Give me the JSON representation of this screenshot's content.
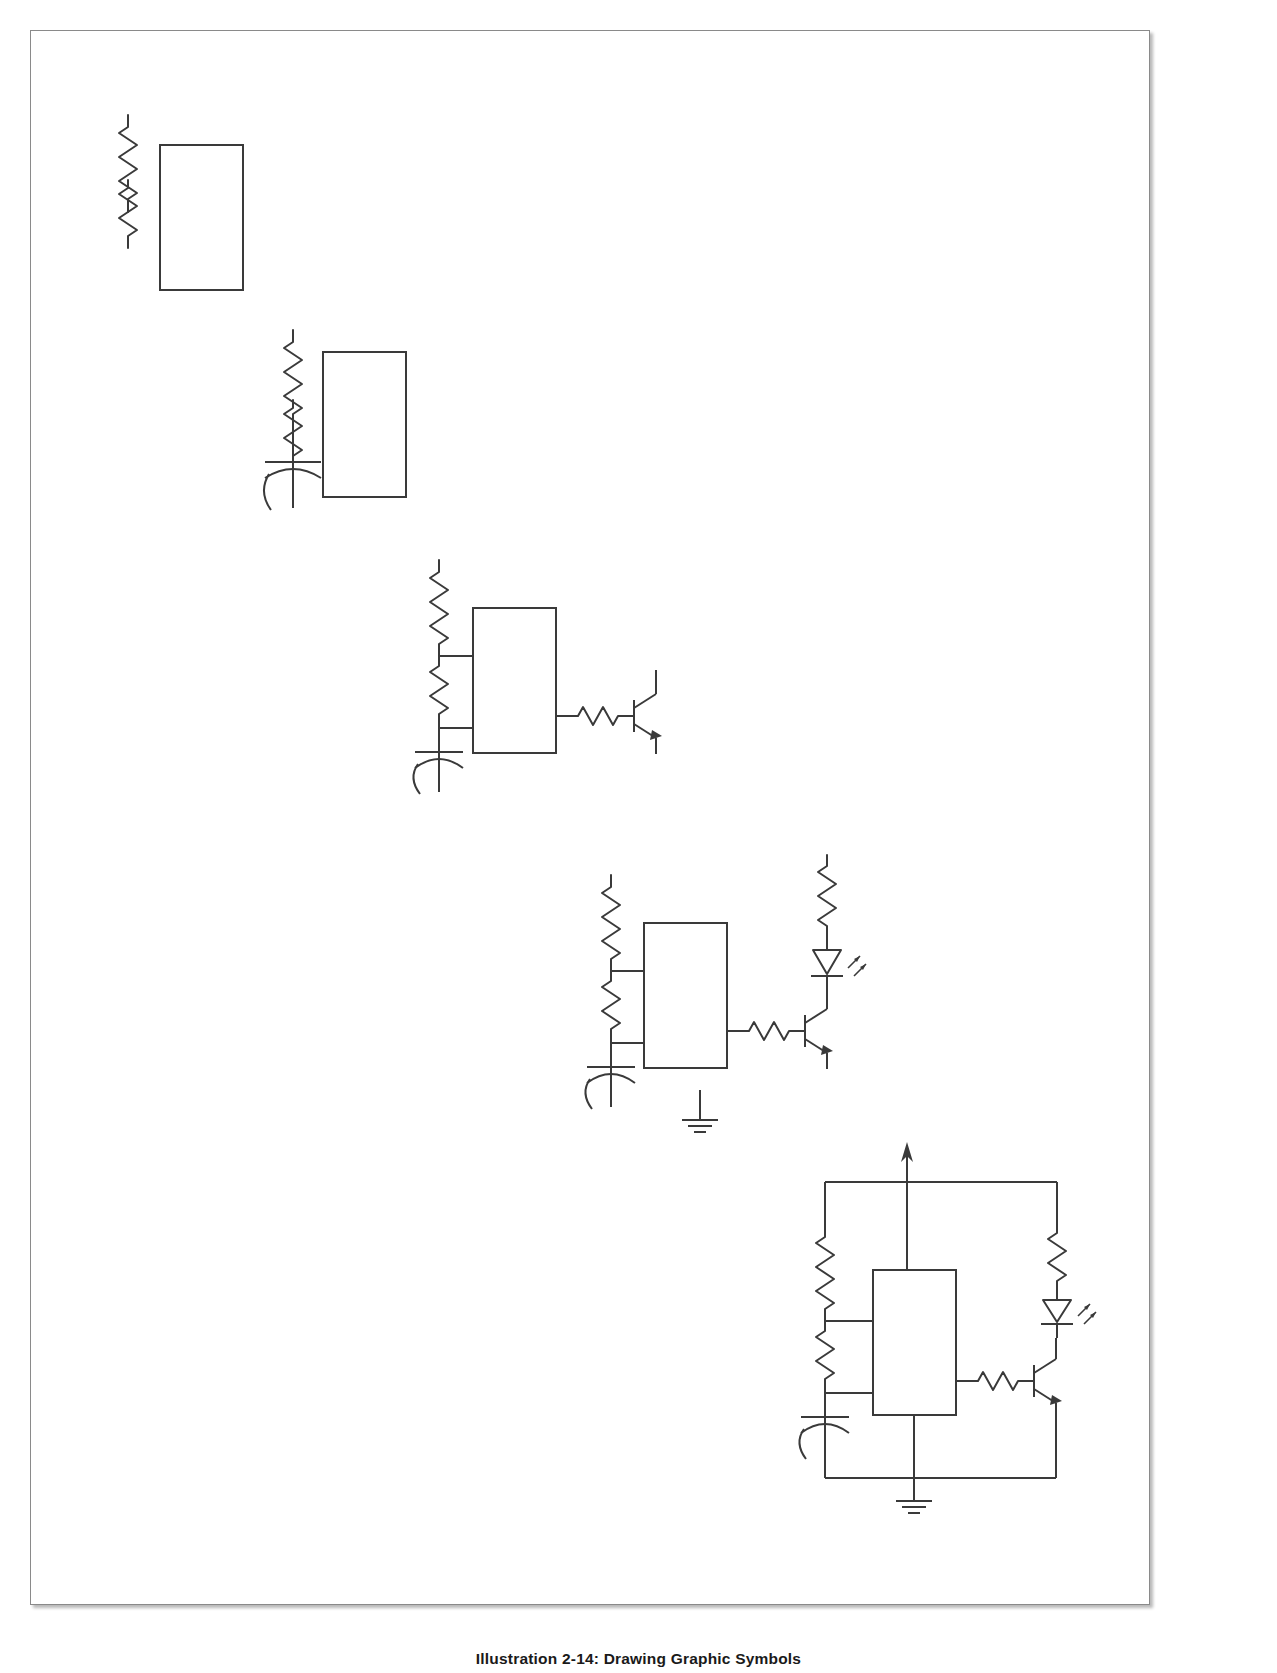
{
  "document": {
    "caption": "Illustration 2-14: Drawing Graphic Symbols",
    "page_background": "#ffffff",
    "frame_border_color": "#8a8a8a",
    "ink_color": "#3a3a3a",
    "stroke_width": 2
  },
  "figure": {
    "stage_count": 5,
    "stages": [
      {
        "index": 1,
        "name": "stage-1-resistors-and-ic-outline",
        "label": "Resistors and IC outline",
        "symbols": [
          "resistor-r1",
          "resistor-r2",
          "ic-body-rectangle"
        ]
      },
      {
        "index": 2,
        "name": "stage-2-add-capacitor",
        "label": "Capacitor added",
        "symbols": [
          "resistor-r1",
          "resistor-r2",
          "capacitor-c1",
          "ic-body-rectangle"
        ]
      },
      {
        "index": 3,
        "name": "stage-3-add-transistor-and-wiring",
        "label": "Transistor and interconnect wiring added",
        "symbols": [
          "resistor-r1",
          "resistor-r2",
          "capacitor-c1",
          "ic-body-rectangle",
          "resistor-r3-base",
          "transistor-q1"
        ]
      },
      {
        "index": 4,
        "name": "stage-4-add-led-and-ground",
        "label": "LED and ground symbol added",
        "symbols": [
          "resistor-r1",
          "resistor-r2",
          "capacitor-c1",
          "ic-body-rectangle",
          "resistor-r3-base",
          "transistor-q1",
          "resistor-r4-led",
          "led-d1",
          "ground-symbol"
        ]
      },
      {
        "index": 5,
        "name": "stage-5-complete-circuit",
        "label": "Complete circuit with supply rail and return",
        "symbols": [
          "resistor-r1",
          "resistor-r2",
          "capacitor-c1",
          "ic-body-rectangle",
          "resistor-r3-base",
          "transistor-q1",
          "resistor-r4-led",
          "led-d1",
          "ground-symbol",
          "supply-rail",
          "supply-arrow",
          "return-rail"
        ]
      }
    ],
    "symbol_legend": [
      {
        "key": "resistor",
        "name": "resistor-zigzag",
        "description": "Zigzag line resistor symbol"
      },
      {
        "key": "capacitor",
        "name": "capacitor-polarized",
        "description": "Straight plate over curved plate polarized capacitor"
      },
      {
        "key": "ic",
        "name": "ic-body-rectangle",
        "description": "Plain rectangle representing integrated circuit body"
      },
      {
        "key": "transistor",
        "name": "transistor-npn",
        "description": "NPN bipolar transistor: base bar, collector lead, emitter lead with arrow"
      },
      {
        "key": "led",
        "name": "light-emitting-diode",
        "description": "Triangle with cathode bar plus two emission arrows"
      },
      {
        "key": "ground",
        "name": "ground-symbol",
        "description": "Three stacked decreasing horizontal bars"
      },
      {
        "key": "supply",
        "name": "supply-arrow",
        "description": "Vertical line terminated by an upward arrowhead indicating supply voltage"
      }
    ]
  }
}
